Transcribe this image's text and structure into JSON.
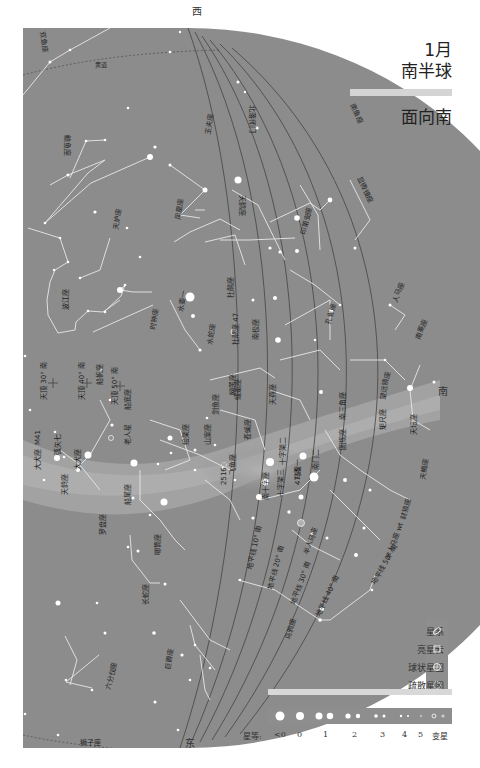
{
  "header": {
    "month": "1月",
    "hemisphere": "南半球",
    "facing": "面向南"
  },
  "directions": {
    "top": "西",
    "right": "南",
    "bottom": "东"
  },
  "legend": {
    "items": [
      {
        "label": "星系",
        "icon": "galaxy-icon"
      },
      {
        "label": "亮星云",
        "icon": "nebula-icon"
      },
      {
        "label": "球状星团",
        "icon": "globular-cluster-icon"
      },
      {
        "label": "疏散星团",
        "icon": "open-cluster-icon"
      }
    ]
  },
  "magnitude_scale": {
    "label": "星等:",
    "ticks": [
      "<0",
      "0",
      "1",
      "2",
      "3",
      "4",
      "5",
      "变星"
    ]
  },
  "map": {
    "ecliptic_label": "黄道",
    "altitude_labels": [
      "地平线 10° 南",
      "地平线 20° 南",
      "地平线 30° 南",
      "地平线 40° 南",
      "地平线 50° 南",
      "地平线 60° 南"
    ],
    "zenith_labels": [
      "天顶 30° 南",
      "天顶 40° 南",
      "天顶 50° 南"
    ],
    "constellations": [
      "双鱼座",
      "鲸鱼座",
      "玉夫座",
      "凤凰座",
      "天炉座",
      "波江座",
      "时钟座",
      "剑鱼座",
      "网罟座",
      "绘架座",
      "山案座",
      "杜鹃座",
      "水蛇座",
      "南极座",
      "天燕座",
      "蝘蜓座",
      "苍蝇座",
      "南十字座",
      "半人马座",
      "船底座",
      "船帆座",
      "船尾座",
      "罗盘座",
      "唧筒座",
      "长蛇座",
      "六分仪座",
      "巨爵座",
      "乌鸦座",
      "天鸽座",
      "大犬座",
      "麒麟座",
      "飞鱼座",
      "印第安座",
      "孔雀座",
      "南三角座",
      "圆规座",
      "矩尺座",
      "天坛座",
      "望远镜座",
      "天蝎座",
      "豺狼座",
      "显微镜座",
      "南鱼座",
      "天鹤座",
      "宝瓶座",
      "雕具座",
      "猎户座",
      "天兔座"
    ],
    "named_stars": [
      "水委一",
      "老人星",
      "天狼星",
      "弧矢七",
      "马腹一",
      "南门二",
      "十字架二",
      "十字架三"
    ],
    "deep_sky": [
      "M41",
      "杜鹃座 47",
      "NGC 2516",
      "4755",
      "ω"
    ]
  }
}
